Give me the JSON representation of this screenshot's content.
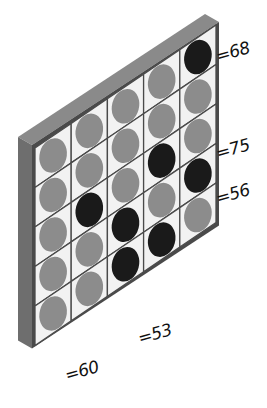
{
  "puzzle": {
    "title": "",
    "rows": 5,
    "cols": 5,
    "grid": [
      [
        "gray",
        "gray",
        "gray",
        "gray",
        "black"
      ],
      [
        "gray",
        "gray",
        "gray",
        "gray",
        "gray"
      ],
      [
        "gray",
        "black",
        "gray",
        "black",
        "gray"
      ],
      [
        "gray",
        "gray",
        "black",
        "gray",
        "black"
      ],
      [
        "gray",
        "gray",
        "black",
        "black",
        "gray"
      ]
    ],
    "row_clues": [
      {
        "row": 1,
        "text": "=68"
      },
      {
        "row": 3,
        "text": "=75"
      },
      {
        "row": 4,
        "text": "=56"
      }
    ],
    "col_clues": [
      {
        "col": 2,
        "text": "=60"
      },
      {
        "col": 4,
        "text": "=53"
      }
    ]
  },
  "colors": {
    "frame_top": "#8a8a8a",
    "frame_side": "#6e6e6e",
    "cell_bg": "#f2f2f2",
    "grid_line": "#4a4a4a",
    "disc_gray": "#8c8c8c",
    "disc_black": "#1a1a1a"
  },
  "icons": {
    "disc_gray": "gray-disc-icon",
    "disc_black": "black-disc-icon"
  }
}
